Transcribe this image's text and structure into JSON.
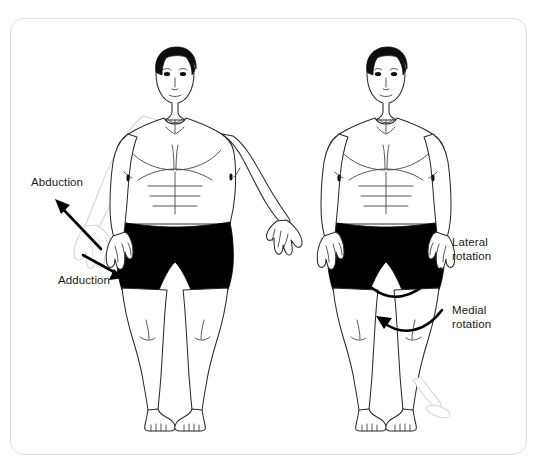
{
  "diagram": {
    "background_color": "#ffffff",
    "border_color": "#dcdcdc",
    "ink_color": "#1a1a1a",
    "ghost_color": "#d8d8d8",
    "shorts_color": "#000000",
    "hair_color": "#0d0d0d"
  },
  "labels": {
    "abduction": "Abduction",
    "adduction": "Adduction",
    "lateral_rotation": "Lateral\nrotation",
    "medial_rotation": "Medial\nrotation"
  },
  "figures": [
    {
      "name": "left-figure",
      "shows": [
        "abduction",
        "adduction"
      ],
      "pose": "standing front view, right arm (viewer left) shown in two positions",
      "ghost_limb": "abducted arm raised away from body"
    },
    {
      "name": "right-figure",
      "shows": [
        "lateral rotation",
        "medial rotation"
      ],
      "pose": "standing front view, arms at sides",
      "ghost_limb": "laterally rotated foot"
    }
  ],
  "arrows": [
    {
      "name": "abduction-arrow",
      "direction": "up-left",
      "style": "straight"
    },
    {
      "name": "adduction-arrow",
      "direction": "down-right",
      "style": "straight"
    },
    {
      "name": "lateral-rotation-arrow",
      "direction": "curving outward to upper right",
      "style": "curved"
    },
    {
      "name": "medial-rotation-arrow",
      "direction": "curving inward to upper left",
      "style": "curved"
    }
  ]
}
